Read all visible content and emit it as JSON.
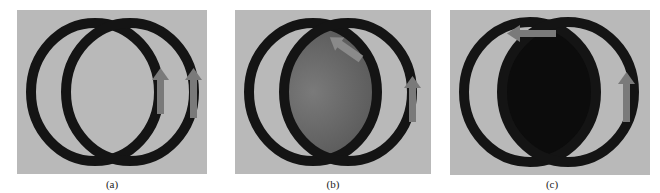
{
  "figure": {
    "panels": [
      {
        "id": "a",
        "caption": "(a)",
        "overlap_fill": "#b9b9b9",
        "arrows": [
          "up-inner",
          "up-outer"
        ]
      },
      {
        "id": "b",
        "caption": "(b)",
        "overlap_fill": "#6a6a6a",
        "arrows": [
          "diagonal-up-left-top",
          "up-outer"
        ]
      },
      {
        "id": "c",
        "caption": "(c)",
        "overlap_fill": "#0c0c0c",
        "arrows": [
          "left-top",
          "up-outer"
        ]
      }
    ],
    "colors": {
      "background": "#b9b9b9",
      "ring": "#141414",
      "arrow": "#7a7a7a"
    }
  }
}
